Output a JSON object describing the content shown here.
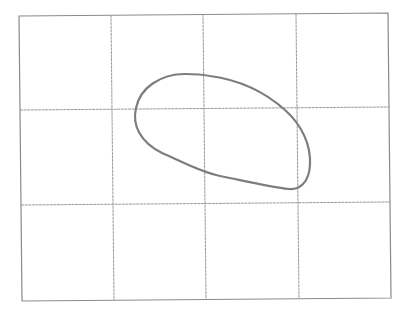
{
  "figure": {
    "grid": {
      "columns": 4,
      "rows": 3,
      "line_color": "#9a9a9a",
      "corners": {
        "top_left": [
          19,
          16
        ],
        "top_right": [
          388,
          13
        ],
        "bottom_right": [
          391,
          298
        ],
        "bottom_left": [
          22,
          301
        ]
      }
    },
    "curve": {
      "shape": "closed-loop",
      "stroke_color": "#7d7d7d",
      "path": "M 185 74 C 160 74, 140 88, 136 108 C 132 125, 140 142, 162 153 C 185 163, 200 172, 220 176 C 245 181, 270 187, 289 189 C 300 190, 309 182, 310 165 C 311 145, 302 125, 285 110 C 265 92, 240 80, 210 76 C 200 74, 192 74, 185 74 Z"
    }
  }
}
